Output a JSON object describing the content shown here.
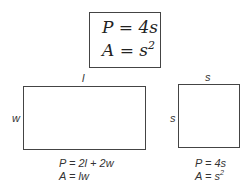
{
  "square_formula_box": {
    "perimeter": {
      "lhs": "P",
      "eq": " = ",
      "rhs": "4s"
    },
    "area": {
      "lhs": "A",
      "eq": " = ",
      "rhs_base": "s",
      "rhs_exp": "2"
    }
  },
  "rectangle": {
    "top_label": "l",
    "side_label": "w",
    "perimeter_formula": "P = 2l + 2w",
    "area_formula": "A = lw"
  },
  "square": {
    "top_label": "s",
    "side_label": "s",
    "perimeter_formula": "P = 4s",
    "area_formula_base": "A = s",
    "area_formula_exp": "2"
  }
}
